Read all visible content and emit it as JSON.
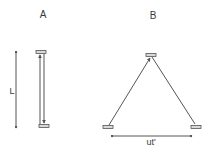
{
  "panels": {
    "a": {
      "title": "A",
      "dimension_label": "L",
      "description": "Light clock at rest: photon travels vertically between two mirrors separated by length L"
    },
    "b": {
      "title": "B",
      "dimension_label": "ut'",
      "description": "Moving light clock: photon travels diagonal path while mirrors move horizontally distance ut'"
    }
  },
  "colors": {
    "line": "#555555",
    "mirror_fill": "#d8d8d8",
    "mirror_stroke": "#555555",
    "text": "#3a3a3a",
    "background": "#ffffff"
  }
}
